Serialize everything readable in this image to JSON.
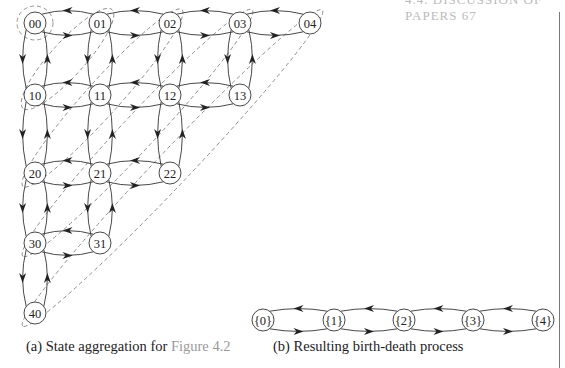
{
  "header": {
    "running_head_fragment": "4.4. DISCUSSION OF PAPERS   67"
  },
  "figure": {
    "subfigure_a": {
      "caption_prefix": "(a) State aggregation for ",
      "caption_ref": "Figure 4.2",
      "nodes": [
        {
          "id": "00",
          "x": 35,
          "y": 23
        },
        {
          "id": "01",
          "x": 100,
          "y": 23
        },
        {
          "id": "02",
          "x": 170,
          "y": 23
        },
        {
          "id": "03",
          "x": 240,
          "y": 23
        },
        {
          "id": "04",
          "x": 310,
          "y": 23
        },
        {
          "id": "10",
          "x": 35,
          "y": 95
        },
        {
          "id": "11",
          "x": 100,
          "y": 95
        },
        {
          "id": "12",
          "x": 170,
          "y": 95
        },
        {
          "id": "13",
          "x": 240,
          "y": 95
        },
        {
          "id": "20",
          "x": 35,
          "y": 173
        },
        {
          "id": "21",
          "x": 100,
          "y": 173
        },
        {
          "id": "22",
          "x": 170,
          "y": 173
        },
        {
          "id": "30",
          "x": 35,
          "y": 243
        },
        {
          "id": "31",
          "x": 100,
          "y": 243
        },
        {
          "id": "40",
          "x": 35,
          "y": 313
        }
      ],
      "aggregation_groups": [
        "{00}",
        "{01,10}",
        "{02,11,20}",
        "{03,12,21,30}",
        "{04,13,22,31,40}"
      ]
    },
    "subfigure_b": {
      "caption": "(b) Resulting birth-death process",
      "nodes": [
        {
          "id": "{0}",
          "x": 263,
          "y": 320
        },
        {
          "id": "{1}",
          "x": 334,
          "y": 320
        },
        {
          "id": "{2}",
          "x": 404,
          "y": 320
        },
        {
          "id": "{3}",
          "x": 473,
          "y": 320
        },
        {
          "id": "{4}",
          "x": 543,
          "y": 320
        }
      ]
    }
  },
  "colors": {
    "stroke": "#333333",
    "dashed": "#888888",
    "ref_link": "#9a9a9a"
  }
}
